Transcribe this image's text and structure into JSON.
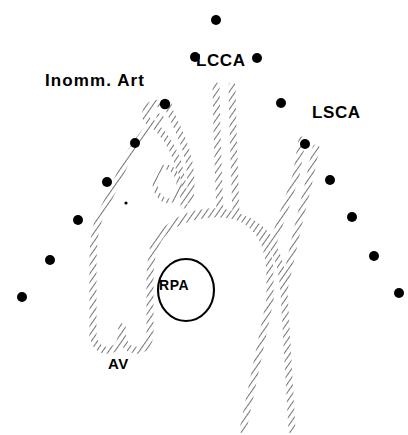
{
  "figure": {
    "background_color": "#ffffff",
    "ink_color": "#000000",
    "width": 408,
    "height": 435
  },
  "labels": {
    "innominate_artery": "Inomm. Art",
    "left_common_carotid": "LCCA",
    "left_subclavian": "LSCA",
    "right_pulmonary_artery": "RPA",
    "aortic_valve": "AV"
  },
  "markers": {
    "name": "fiducial-dots",
    "color": "#000000",
    "points": [
      {
        "x": 216,
        "y": 20,
        "r": 5.0
      },
      {
        "x": 195,
        "y": 57,
        "r": 5.0
      },
      {
        "x": 257,
        "y": 58,
        "r": 5.0
      },
      {
        "x": 165,
        "y": 104,
        "r": 5.2
      },
      {
        "x": 281,
        "y": 103,
        "r": 5.0
      },
      {
        "x": 135,
        "y": 143,
        "r": 5.0
      },
      {
        "x": 305,
        "y": 144,
        "r": 5.0
      },
      {
        "x": 107,
        "y": 182,
        "r": 5.0
      },
      {
        "x": 330,
        "y": 180,
        "r": 5.0
      },
      {
        "x": 126,
        "y": 203,
        "r": 1.6
      },
      {
        "x": 78,
        "y": 220,
        "r": 5.0
      },
      {
        "x": 352,
        "y": 217,
        "r": 5.0
      },
      {
        "x": 50,
        "y": 260,
        "r": 5.0
      },
      {
        "x": 374,
        "y": 256,
        "r": 5.0
      },
      {
        "x": 22,
        "y": 297,
        "r": 5.0
      },
      {
        "x": 399,
        "y": 293,
        "r": 5.0
      }
    ]
  },
  "vessels": {
    "ascending_aorta": "ascending-aorta",
    "aortic_arch": "aortic-arch",
    "descending_aorta": "descending-aorta",
    "innominate_artery": "innominate-artery",
    "left_common_carotid_artery": "left-common-carotid-artery",
    "left_subclavian_artery": "left-subclavian-artery",
    "aortic_valve_cusps": "aortic-valve-cusps",
    "rpa_cross_section": "rpa-cross-section",
    "inner_loop": "inner-vessel-loop",
    "hook_stub": "innominate-hook-stub"
  }
}
